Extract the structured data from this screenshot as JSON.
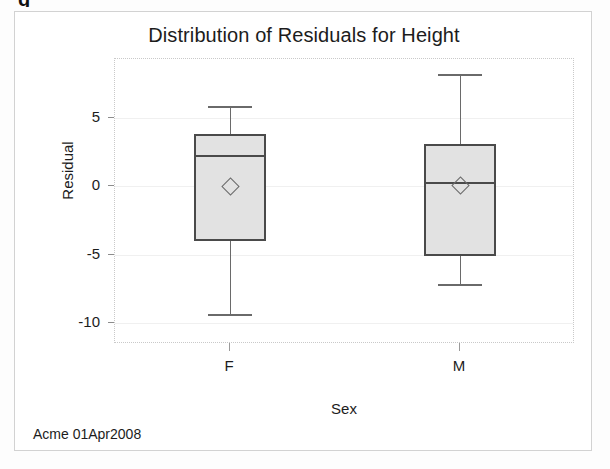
{
  "figure": {
    "title": "Distribution of Residuals for Height",
    "footer": "Acme 01Apr2008",
    "top_glyph": "g"
  },
  "axes": {
    "y_title": "Residual",
    "x_title": "Sex",
    "y_ticks": [
      "5",
      "0",
      "-5",
      "-10"
    ],
    "x_ticks": [
      "F",
      "M"
    ]
  },
  "chart_data": {
    "type": "box",
    "title": "Distribution of Residuals for Height",
    "xlabel": "Sex",
    "ylabel": "Residual",
    "categories": [
      "F",
      "M"
    ],
    "ytick_values": [
      5,
      0,
      -5,
      -10
    ],
    "ylim": [
      -11.5,
      9.3
    ],
    "grid": true,
    "legend": null,
    "boxes": [
      {
        "category": "F",
        "min": -9.3,
        "q1": -4.0,
        "median": 2.3,
        "q3": 3.8,
        "max": 5.9,
        "mean": 0.0
      },
      {
        "category": "M",
        "min": -7.1,
        "q1": -5.1,
        "median": 0.3,
        "q3": 3.1,
        "max": 8.2,
        "mean": 0.1
      }
    ]
  },
  "style": {
    "box_fill": "#e2e2e2",
    "box_edge": "#4a4a4a",
    "whisker": "#6a6a6a",
    "grid_color": "#f0f0f0",
    "frame_color": "#c9c9c9",
    "text_color": "#1c1c1c"
  }
}
